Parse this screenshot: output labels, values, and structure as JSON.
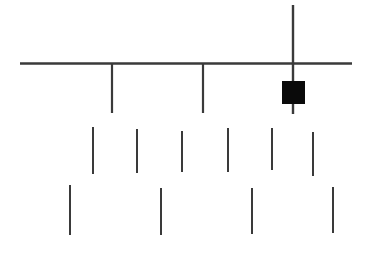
{
  "figure": {
    "title": "",
    "background_color": "#ffffff",
    "stroke_color": "#3a3a3a",
    "fill_color": "#0a0a0a",
    "width": 370,
    "height": 262
  },
  "chart_data": {
    "type": "diagram",
    "title": "",
    "subtitle": "",
    "xlabel": "",
    "ylabel": "",
    "grid": false,
    "legend": null,
    "annotations": [],
    "xlim": [
      0,
      370
    ],
    "ylim": [
      0,
      262
    ],
    "elements": {
      "horizontal_rule": {
        "name": "horizontal-rule",
        "x1": 20,
        "y1": 63.5,
        "x2": 352,
        "y2": 63.5,
        "stroke_width": 2.4
      },
      "long_vertical_bar": {
        "name": "long-vertical-bar",
        "x1": 293,
        "y1": 5,
        "x2": 293,
        "y2": 114,
        "stroke_width": 2.4
      },
      "filled_square": {
        "name": "filled-square",
        "x": 282,
        "y": 81,
        "width": 23,
        "height": 23
      },
      "hanging_ticks": [
        {
          "name": "hanging-tick-1",
          "x": 112,
          "y1": 63,
          "y2": 113,
          "stroke_width": 2.2
        },
        {
          "name": "hanging-tick-2",
          "x": 203,
          "y1": 63,
          "y2": 113,
          "stroke_width": 2.2
        }
      ],
      "middle_row_strokes": [
        {
          "name": "middle-stroke-1",
          "x": 93,
          "y1": 127,
          "y2": 174,
          "stroke_width": 2.0
        },
        {
          "name": "middle-stroke-2",
          "x": 137,
          "y1": 129,
          "y2": 173,
          "stroke_width": 2.0
        },
        {
          "name": "middle-stroke-3",
          "x": 182,
          "y1": 131,
          "y2": 172,
          "stroke_width": 2.0
        },
        {
          "name": "middle-stroke-4",
          "x": 228,
          "y1": 128,
          "y2": 172,
          "stroke_width": 2.0
        },
        {
          "name": "middle-stroke-5",
          "x": 272,
          "y1": 128,
          "y2": 170,
          "stroke_width": 2.0
        },
        {
          "name": "middle-stroke-6",
          "x": 313,
          "y1": 132,
          "y2": 176,
          "stroke_width": 2.0
        }
      ],
      "bottom_row_strokes": [
        {
          "name": "bottom-stroke-1",
          "x": 70,
          "y1": 185,
          "y2": 235,
          "stroke_width": 2.0
        },
        {
          "name": "bottom-stroke-2",
          "x": 161,
          "y1": 188,
          "y2": 235,
          "stroke_width": 2.0
        },
        {
          "name": "bottom-stroke-3",
          "x": 252,
          "y1": 188,
          "y2": 234,
          "stroke_width": 2.0
        },
        {
          "name": "bottom-stroke-4",
          "x": 333,
          "y1": 187,
          "y2": 233,
          "stroke_width": 2.0
        }
      ]
    }
  }
}
